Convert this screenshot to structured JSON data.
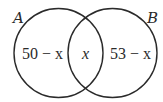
{
  "diagram": {
    "type": "venn",
    "sets": [
      {
        "name": "A",
        "label": "A"
      },
      {
        "name": "B",
        "label": "B"
      }
    ],
    "regions": {
      "a_only": "50 − x",
      "intersection": "x",
      "b_only": "53 − x"
    },
    "colors": {
      "stroke": "#2a2a2a",
      "background": "#ffffff"
    }
  }
}
